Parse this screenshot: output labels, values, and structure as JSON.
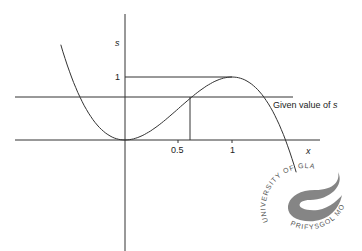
{
  "chart_data": {
    "type": "line",
    "title": "",
    "function": "s = 3x^2 - 2x^3",
    "xlabel": "x",
    "ylabel": "s",
    "x_ticks": [
      "0.5",
      "1"
    ],
    "y_ticks": [
      "1"
    ],
    "series": [
      {
        "name": "s(x)",
        "x": [
          -0.6,
          -0.4,
          -0.2,
          0,
          0.2,
          0.4,
          0.6,
          0.8,
          1.0,
          1.2,
          1.4,
          1.6
        ],
        "values": [
          1.512,
          0.608,
          0.136,
          0,
          0.104,
          0.352,
          0.648,
          0.896,
          1.0,
          0.864,
          0.392,
          -0.512
        ]
      }
    ],
    "annotations": [
      {
        "type": "hline",
        "y": 1,
        "x_range": [
          0,
          1
        ]
      },
      {
        "type": "hline",
        "y": 0.68,
        "label": "Given value of s"
      },
      {
        "type": "vline",
        "x": 0.61,
        "y_range": [
          0,
          0.68
        ]
      }
    ],
    "grid": false
  },
  "labels": {
    "y_axis": "s",
    "x_axis": "x",
    "y_one": "1",
    "x_half": "0.5",
    "x_one": "1",
    "given_value": "Given value of ",
    "given_value_var": "s"
  },
  "watermark": {
    "text_top": "UNIVERSITY OF GLAMORGAN",
    "text_bottom": "PRIFYSGOL MORGANNWG"
  },
  "colors": {
    "line": "#333333",
    "background": "#ffffff"
  }
}
